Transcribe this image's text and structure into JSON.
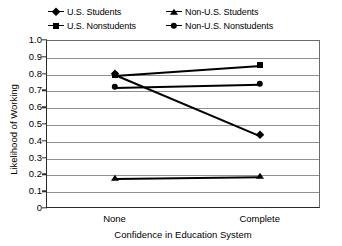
{
  "chart_data": {
    "type": "line",
    "title": "",
    "xlabel": "Confidence in Education System",
    "ylabel": "Likelihood of Working",
    "categories": [
      "None",
      "Complete"
    ],
    "ylim": [
      0,
      1.0
    ],
    "ytick_labels": [
      "1.0",
      "0.9",
      "0.8",
      "0.7",
      "0.6",
      "0.5",
      "0.4",
      "0.3",
      "0.2",
      "0.1",
      "0"
    ],
    "ytick_values": [
      1.0,
      0.9,
      0.8,
      0.7,
      0.6,
      0.5,
      0.4,
      0.3,
      0.2,
      0.1,
      0
    ],
    "grid": true,
    "legend_position": "top",
    "series": [
      {
        "name": "U.S. Students",
        "marker": "diamond",
        "values": [
          0.8,
          0.435
        ]
      },
      {
        "name": "U.S. Nonstudents",
        "marker": "square",
        "values": [
          0.79,
          0.85
        ]
      },
      {
        "name": "Non-U.S. Students",
        "marker": "triangle",
        "values": [
          0.18,
          0.19
        ]
      },
      {
        "name": "Non-U.S. Nonstudents",
        "marker": "circle",
        "values": [
          0.72,
          0.74
        ]
      }
    ]
  },
  "legend": {
    "entries": [
      {
        "label": "U.S. Students",
        "marker": "diamond"
      },
      {
        "label": "Non-U.S. Students",
        "marker": "triangle"
      },
      {
        "label": "U.S. Nonstudents",
        "marker": "square"
      },
      {
        "label": "Non-U.S. Nonstudents",
        "marker": "circle"
      }
    ]
  },
  "colors": {
    "series": "#000000",
    "grid": "#8f8f8f",
    "axis": "#2b2b2b",
    "background": "#ffffff"
  }
}
